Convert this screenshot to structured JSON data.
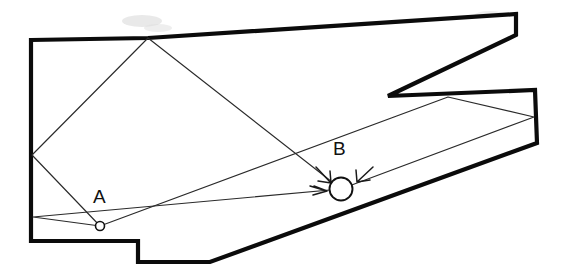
{
  "figure": {
    "canvas": {
      "width": 563,
      "height": 272
    },
    "background_color": "#ffffff",
    "outline_color": "#0b0b0b",
    "ray_color": "#2a2a2a",
    "labels": {
      "source_label": "A",
      "target_label": "B"
    }
  },
  "chart_data": {
    "type": "diagram",
    "xlabel": "",
    "ylabel": "",
    "xlim": [
      0,
      563
    ],
    "ylim": [
      272,
      0
    ],
    "grid": false,
    "legend": null,
    "room_polygon": {
      "name": "room-boundary",
      "stroke": "#0b0b0b",
      "stroke_width": 4.2,
      "fill": "#ffffff",
      "closed": true,
      "vertices": [
        [
          31,
          40
        ],
        [
          148,
          38
        ],
        [
          516,
          14
        ],
        [
          516,
          35
        ],
        [
          388,
          96
        ],
        [
          535,
          90
        ],
        [
          537,
          143
        ],
        [
          210,
          262
        ],
        [
          138,
          262
        ],
        [
          138,
          241
        ],
        [
          31,
          241
        ]
      ]
    },
    "points": [
      {
        "name": "A",
        "label": "A",
        "x": 100,
        "y": 226,
        "radius": 4.5,
        "label_x": 93,
        "label_y": 203
      },
      {
        "name": "B",
        "label": "B",
        "x": 341,
        "y": 189,
        "radius": 11.5,
        "label_x": 333,
        "label_y": 155
      }
    ],
    "reflection_vertices": [
      {
        "name": "left-wall-upper-bounce",
        "x": 32,
        "y": 155
      },
      {
        "name": "top-wall-bounce",
        "x": 148,
        "y": 38
      },
      {
        "name": "left-wall-lower-bounce",
        "x": 33,
        "y": 217
      },
      {
        "name": "right-notch-bounce",
        "x": 448,
        "y": 97
      },
      {
        "name": "right-wall-bounce",
        "x": 534,
        "y": 117
      }
    ],
    "ray_paths": [
      {
        "name": "path-A-topwall-B",
        "description": "A reflects off left wall, then top wall, then travels to B",
        "points": [
          [
            100,
            226
          ],
          [
            32,
            155
          ],
          [
            148,
            38
          ],
          [
            341,
            189
          ]
        ],
        "arrow_at_end": true
      },
      {
        "name": "path-A-leftwall-B",
        "description": "A reflects off lower left wall then travels directly to B",
        "points": [
          [
            100,
            226
          ],
          [
            33,
            217
          ],
          [
            341,
            189
          ]
        ],
        "arrow_at_end": true
      },
      {
        "name": "path-A-rightnotch-B",
        "description": "A travels right, reflects off notch ceiling then right wall, returns to B",
        "points": [
          [
            100,
            226
          ],
          [
            448,
            97
          ],
          [
            534,
            117
          ],
          [
            341,
            189
          ]
        ],
        "arrow_at_end": true
      }
    ],
    "arrowheads": [
      {
        "name": "arrowhead-into-B-from-upper-left",
        "tip_x": 330,
        "tip_y": 182,
        "angle_deg": 45
      },
      {
        "name": "arrowhead-into-B-from-left",
        "tip_x": 326,
        "tip_y": 191,
        "angle_deg": 5
      },
      {
        "name": "arrowhead-into-B-from-upper-right",
        "tip_x": 357,
        "tip_y": 181,
        "angle_deg": 140
      }
    ]
  }
}
